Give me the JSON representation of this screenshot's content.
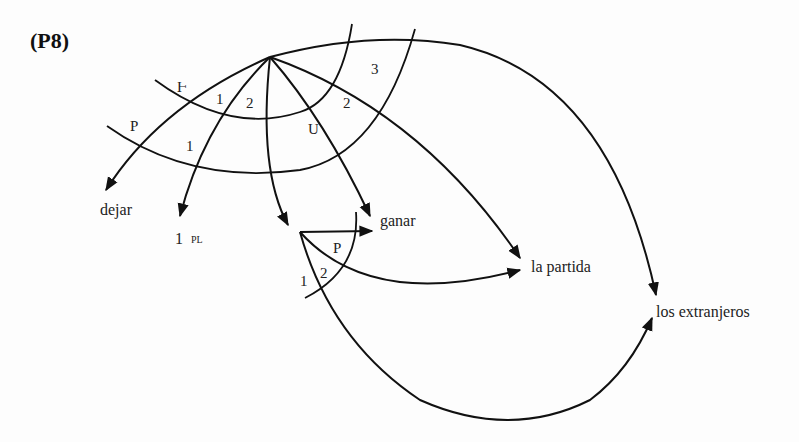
{
  "title": "(P8)",
  "diagram": {
    "type": "relational-network",
    "nodes": {
      "top_vertex": {
        "x": 270,
        "y": 57
      },
      "sub_vertex": {
        "x": 300,
        "y": 232
      }
    },
    "stratal_labels": {
      "outer_left_top": "Ⱶ",
      "outer_left_bottom": "P",
      "arc_1a": "1",
      "arc_2a": "2",
      "arc_1b": "1",
      "arc_U": "U",
      "arc_2b": "2",
      "arc_3": "3",
      "sub_P": "P",
      "sub_2": "2",
      "sub_1": "1"
    },
    "terminals": {
      "dejar": "dejar",
      "one_pl": "1",
      "one_pl_sub": "PL",
      "ganar": "ganar",
      "la_partida": "la partida",
      "los_extranjeros": "los extranjeros"
    },
    "stroke_color": "#111111",
    "background_color": "#fdfdfd"
  }
}
